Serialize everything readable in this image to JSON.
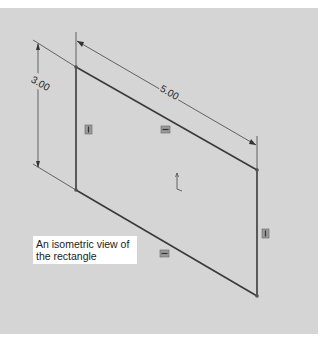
{
  "figure": {
    "caption": "An isometric view of the rectangle",
    "background_color": "#d5d5d5",
    "line_color": "#3a3a3a"
  },
  "sketch": {
    "rectangle": {
      "vertices": {
        "top_left": [
          76,
          67
        ],
        "top_right": [
          257,
          170
        ],
        "bottom_right": [
          257,
          296
        ],
        "bottom_left": [
          76,
          190
        ]
      }
    },
    "dimensions": [
      {
        "name": "height",
        "label": "3.00"
      },
      {
        "name": "width",
        "label": "5.00"
      }
    ],
    "relations": [
      {
        "name": "vertical-left",
        "symbol": "vertical"
      },
      {
        "name": "horizontal-top",
        "symbol": "horizontal"
      },
      {
        "name": "horizontal-bottom",
        "symbol": "horizontal"
      },
      {
        "name": "vertical-right",
        "symbol": "vertical"
      }
    ],
    "origin_marker": "origin"
  }
}
